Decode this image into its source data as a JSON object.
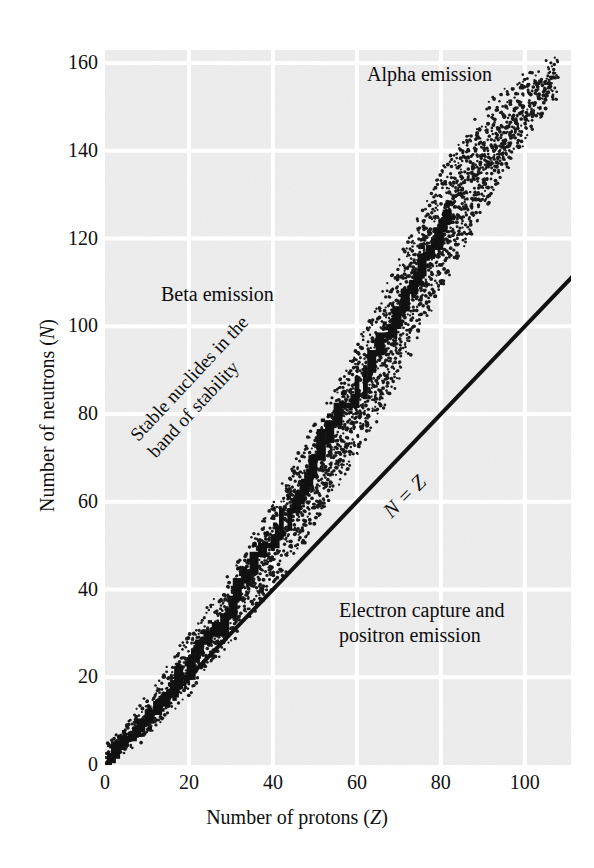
{
  "figure": {
    "kind": "scatter-band-diagram",
    "background_color": "#ffffff",
    "plot_background_color": "#ededed",
    "gridline_color": "#ffffff",
    "ink_color": "#101010"
  },
  "axes": {
    "x_title": "Number of protons (Z)",
    "x_title_plain": "Number of protons",
    "x_title_symbol": "Z",
    "y_title": "Number of neutrons (N)",
    "y_title_plain": "Number of neutrons",
    "y_title_symbol": "N"
  },
  "annotations": {
    "alpha": "Alpha emission",
    "beta": "Beta emission",
    "electron_capture_line1": "Electron capture and",
    "electron_capture_line2": "positron emission",
    "stable_line1": "Stable nuclides in the",
    "stable_line2": "band of stability",
    "nz_line": "N = Z"
  },
  "chart_data": {
    "type": "scatter",
    "title": "",
    "subtitle": "",
    "xlabel": "Number of protons (Z)",
    "ylabel": "Number of neutrons (N)",
    "xlim": [
      0,
      111
    ],
    "ylim": [
      0,
      163
    ],
    "xticks": [
      0,
      20,
      40,
      60,
      80,
      100
    ],
    "xticklabels": [
      "0",
      "20",
      "40",
      "60",
      "80",
      "100"
    ],
    "yticks": [
      0,
      20,
      40,
      60,
      80,
      100,
      120,
      140,
      160
    ],
    "yticklabels": [
      "0",
      "20",
      "40",
      "60",
      "80",
      "100",
      "120",
      "140",
      "160"
    ],
    "grid": true,
    "grid_color": "#ffffff",
    "legend": "none",
    "legend_position": "none",
    "series": [
      {
        "name": "N = Z reference line",
        "type": "line",
        "color": "#111111",
        "linewidth": 4,
        "x": [
          0,
          111
        ],
        "y": [
          0,
          111
        ],
        "label": "N = Z"
      },
      {
        "name": "Band of stability (stable nuclides)",
        "type": "scatter",
        "marker": "square",
        "color": "#111111",
        "description": "Staircase ridge of stable nuclides rising above N = Z as Z increases",
        "points_zn": [
          [
            1,
            0
          ],
          [
            1,
            1
          ],
          [
            2,
            2
          ],
          [
            3,
            4
          ],
          [
            4,
            5
          ],
          [
            5,
            6
          ],
          [
            6,
            6
          ],
          [
            7,
            7
          ],
          [
            8,
            8
          ],
          [
            9,
            10
          ],
          [
            10,
            10
          ],
          [
            11,
            12
          ],
          [
            12,
            12
          ],
          [
            13,
            14
          ],
          [
            14,
            14
          ],
          [
            15,
            16
          ],
          [
            16,
            16
          ],
          [
            17,
            18
          ],
          [
            18,
            22
          ],
          [
            19,
            20
          ],
          [
            20,
            20
          ],
          [
            21,
            24
          ],
          [
            22,
            26
          ],
          [
            23,
            28
          ],
          [
            24,
            28
          ],
          [
            25,
            30
          ],
          [
            26,
            30
          ],
          [
            27,
            32
          ],
          [
            28,
            30
          ],
          [
            29,
            34
          ],
          [
            30,
            34
          ],
          [
            31,
            38
          ],
          [
            32,
            42
          ],
          [
            33,
            42
          ],
          [
            34,
            44
          ],
          [
            35,
            44
          ],
          [
            36,
            48
          ],
          [
            37,
            48
          ],
          [
            38,
            50
          ],
          [
            39,
            50
          ],
          [
            40,
            50
          ],
          [
            41,
            52
          ],
          [
            42,
            54
          ],
          [
            44,
            58
          ],
          [
            45,
            58
          ],
          [
            46,
            60
          ],
          [
            47,
            62
          ],
          [
            48,
            64
          ],
          [
            49,
            66
          ],
          [
            50,
            70
          ],
          [
            51,
            70
          ],
          [
            52,
            76
          ],
          [
            53,
            74
          ],
          [
            54,
            78
          ],
          [
            55,
            78
          ],
          [
            56,
            82
          ],
          [
            57,
            82
          ],
          [
            58,
            82
          ],
          [
            59,
            82
          ],
          [
            60,
            84
          ],
          [
            62,
            88
          ],
          [
            63,
            90
          ],
          [
            64,
            94
          ],
          [
            65,
            94
          ],
          [
            66,
            98
          ],
          [
            67,
            98
          ],
          [
            68,
            98
          ],
          [
            69,
            100
          ],
          [
            70,
            104
          ],
          [
            71,
            104
          ],
          [
            72,
            108
          ],
          [
            73,
            108
          ],
          [
            74,
            110
          ],
          [
            75,
            112
          ],
          [
            76,
            116
          ],
          [
            77,
            116
          ],
          [
            78,
            118
          ],
          [
            79,
            118
          ],
          [
            80,
            122
          ],
          [
            81,
            124
          ],
          [
            82,
            126
          ]
        ]
      },
      {
        "name": "Unstable nuclide cloud (stipple)",
        "type": "scatter",
        "marker": "dot",
        "color": "#1a1a1a",
        "description": "Dense stippled envelope of unstable nuclides flanking the band of stability, widening with Z and extending to N ~ 158 at Z ~ 108",
        "envelope_upper_zn": [
          [
            0,
            4
          ],
          [
            10,
            16
          ],
          [
            20,
            30
          ],
          [
            30,
            44
          ],
          [
            40,
            60
          ],
          [
            50,
            78
          ],
          [
            60,
            96
          ],
          [
            70,
            116
          ],
          [
            80,
            136
          ],
          [
            90,
            150
          ],
          [
            100,
            158
          ],
          [
            108,
            162
          ]
        ],
        "envelope_lower_zn": [
          [
            1,
            0
          ],
          [
            10,
            6
          ],
          [
            20,
            16
          ],
          [
            30,
            28
          ],
          [
            40,
            40
          ],
          [
            50,
            54
          ],
          [
            60,
            70
          ],
          [
            70,
            88
          ],
          [
            80,
            108
          ],
          [
            90,
            126
          ],
          [
            100,
            142
          ],
          [
            108,
            152
          ]
        ]
      }
    ],
    "annotations": [
      {
        "text": "Alpha emission",
        "region": "upper-right",
        "zn": [
          62,
          152
        ]
      },
      {
        "text": "Beta emission",
        "region": "upper-left of band",
        "zn": [
          18,
          105
        ]
      },
      {
        "text": "Electron capture and positron emission",
        "region": "lower-right",
        "zn": [
          62,
          33
        ]
      },
      {
        "text": "Stable nuclides in the band of stability",
        "region": "along band",
        "zn": [
          22,
          60
        ],
        "rotation": -47
      },
      {
        "text": "N = Z",
        "region": "along diagonal",
        "zn": [
          52,
          46
        ],
        "rotation": -45
      }
    ]
  }
}
